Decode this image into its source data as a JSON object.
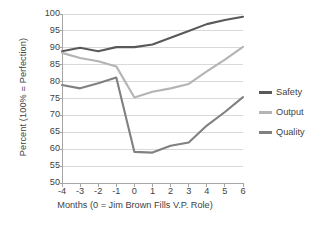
{
  "chart_data": {
    "type": "line",
    "title": "",
    "xlabel": "Months (0 = Jim Brown Fills V.P. Role)",
    "ylabel": "Percent (100% = Perfection)",
    "x": [
      -4,
      -3,
      -2,
      -1,
      0,
      1,
      2,
      3,
      4,
      5,
      6
    ],
    "xticklabels": [
      "-4",
      "-3",
      "-2",
      "-1",
      "0",
      "1",
      "2",
      "3",
      "4",
      "5",
      "6"
    ],
    "yticklabels": [
      "100",
      "95",
      "90",
      "85",
      "80",
      "75",
      "70",
      "65",
      "60",
      "55",
      "50"
    ],
    "ylim": [
      50,
      100
    ],
    "ytick_step": 5,
    "xlim": [
      -4,
      6
    ],
    "grid": "horizontal",
    "legend_position": "right",
    "series": [
      {
        "name": "Safety",
        "color": "#595959",
        "values": [
          89.0,
          90.0,
          89.0,
          90.2,
          90.2,
          91.0,
          93.0,
          95.0,
          97.0,
          98.2,
          99.2
        ]
      },
      {
        "name": "Output",
        "color": "#b4b4b4",
        "values": [
          88.5,
          87.0,
          86.0,
          84.5,
          75.3,
          77.0,
          78.0,
          79.3,
          83.0,
          86.5,
          90.3
        ]
      },
      {
        "name": "Quality",
        "color": "#808080",
        "values": [
          79.0,
          78.0,
          79.5,
          81.2,
          59.2,
          59.0,
          61.0,
          62.0,
          67.0,
          71.0,
          75.4
        ]
      }
    ]
  },
  "legend": {
    "items": [
      {
        "label": "Safety",
        "color": "#595959"
      },
      {
        "label": "Output",
        "color": "#b4b4b4"
      },
      {
        "label": "Quality",
        "color": "#808080"
      }
    ]
  },
  "axes": {
    "y_title": "Percent (100% = Perfection)",
    "x_title": "Months (0 = Jim Brown Fills V.P. Role)"
  },
  "colors": {
    "grid": "#d9d9d9",
    "axis": "#a6a6a6",
    "text": "#3f3f3f",
    "background": "#ffffff"
  }
}
